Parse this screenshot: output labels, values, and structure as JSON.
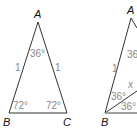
{
  "figure_left": {
    "vertices": {
      "A": "A",
      "B": "B",
      "C": "C"
    },
    "sides": {
      "AB": "1",
      "AC": "1"
    },
    "angles": {
      "A": "36°",
      "B": "72°",
      "C": "72°"
    }
  },
  "figure_right": {
    "vertices": {
      "A": "A",
      "B": "B"
    },
    "sides": {
      "AB": "1",
      "bisector": "x"
    },
    "angles": {
      "A": "36",
      "B_upper": "36°",
      "B_lower": "36°"
    }
  },
  "colors": {
    "edge": "#333333",
    "label": "#888888",
    "vertex": "#111111"
  }
}
